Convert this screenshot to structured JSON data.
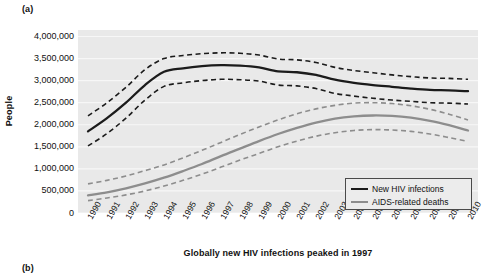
{
  "panels": {
    "a_label": "(a)",
    "b_label": "(b)"
  },
  "legend": {
    "items": [
      {
        "label": "New HIV infections",
        "color": "#1b1b1b",
        "swatch": "solid-line-dark"
      },
      {
        "label": "AIDS-related deaths",
        "color": "#8d8d8d",
        "swatch": "solid-line-gray"
      }
    ]
  },
  "chart_data": {
    "type": "line",
    "title": "",
    "caption": "Globally new HIV infections peaked in 1997",
    "xlabel": "",
    "ylabel": "People",
    "ylim": [
      0,
      4000000
    ],
    "xlim": [
      1990,
      2010
    ],
    "grid": true,
    "grid_color": "#f7f7f7",
    "plot_background": "#e9e9e9",
    "legend_position": "bottom-right",
    "ytick_labels": [
      "4,000,000",
      "3,500,000",
      "3,000,000",
      "2,500,000",
      "2,000,000",
      "1,500,000",
      "1,000,000",
      "500,000",
      "0"
    ],
    "ytick_values": [
      4000000,
      3500000,
      3000000,
      2500000,
      2000000,
      1500000,
      1000000,
      500000,
      0
    ],
    "categories": [
      "1990",
      "1991",
      "1992",
      "1993",
      "1994",
      "1995",
      "1996",
      "1997",
      "1998",
      "1999",
      "2000",
      "2001",
      "2002",
      "2003",
      "2004",
      "2005",
      "2006",
      "2007",
      "2008",
      "2009",
      "2010"
    ],
    "x": [
      1990,
      1991,
      1992,
      1993,
      1994,
      1995,
      1996,
      1997,
      1998,
      1999,
      2000,
      2001,
      2002,
      2003,
      2004,
      2005,
      2006,
      2007,
      2008,
      2009,
      2010
    ],
    "series": [
      {
        "name": "New HIV infections",
        "color": "#1b1b1b",
        "style": "solid",
        "values": [
          1850000,
          2150000,
          2500000,
          2900000,
          3200000,
          3280000,
          3330000,
          3350000,
          3340000,
          3300000,
          3210000,
          3190000,
          3130000,
          3020000,
          2950000,
          2900000,
          2860000,
          2820000,
          2790000,
          2780000,
          2760000
        ],
        "upper_ci": {
          "name": "New HIV infections upper bound",
          "style": "dashed",
          "values": [
            2200000,
            2500000,
            2850000,
            3250000,
            3500000,
            3570000,
            3610000,
            3630000,
            3620000,
            3580000,
            3490000,
            3470000,
            3410000,
            3300000,
            3230000,
            3180000,
            3130000,
            3090000,
            3060000,
            3050000,
            3030000
          ]
        },
        "lower_ci": {
          "name": "New HIV infections lower bound",
          "style": "dashed",
          "values": [
            1520000,
            1800000,
            2150000,
            2560000,
            2870000,
            2950000,
            3000000,
            3030000,
            3020000,
            2990000,
            2900000,
            2880000,
            2820000,
            2710000,
            2650000,
            2600000,
            2560000,
            2530000,
            2500000,
            2490000,
            2470000
          ]
        }
      },
      {
        "name": "AIDS-related deaths",
        "color": "#8d8d8d",
        "style": "solid",
        "values": [
          400000,
          470000,
          560000,
          670000,
          800000,
          950000,
          1110000,
          1290000,
          1460000,
          1630000,
          1790000,
          1930000,
          2050000,
          2140000,
          2190000,
          2210000,
          2200000,
          2160000,
          2090000,
          1990000,
          1870000
        ],
        "upper_ci": {
          "name": "AIDS-related deaths upper bound",
          "style": "dashed",
          "values": [
            660000,
            740000,
            840000,
            960000,
            1090000,
            1250000,
            1420000,
            1600000,
            1780000,
            1950000,
            2110000,
            2250000,
            2360000,
            2440000,
            2490000,
            2500000,
            2480000,
            2430000,
            2350000,
            2240000,
            2110000
          ]
        },
        "lower_ci": {
          "name": "AIDS-related deaths lower bound",
          "style": "dashed",
          "values": [
            280000,
            340000,
            410000,
            500000,
            610000,
            740000,
            880000,
            1040000,
            1200000,
            1350000,
            1500000,
            1630000,
            1740000,
            1820000,
            1870000,
            1890000,
            1880000,
            1850000,
            1790000,
            1710000,
            1620000
          ]
        }
      }
    ]
  }
}
